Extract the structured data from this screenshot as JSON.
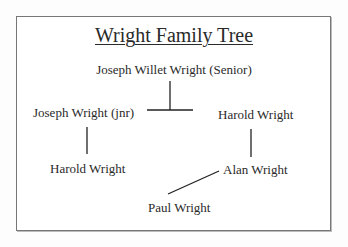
{
  "diagram": {
    "title": "Wright Family Tree",
    "nodes": {
      "root": "Joseph Willet Wright (Senior)",
      "child_left": "Joseph Wright (jnr)",
      "child_right": "Harold Wright",
      "grandchild_left": "Harold Wright",
      "grandchild_right": "Alan Wright",
      "great_grandchild": "Paul Wright"
    },
    "edges": [
      {
        "from": "root",
        "to": "child_left"
      },
      {
        "from": "root",
        "to": "child_right"
      },
      {
        "from": "child_left",
        "to": "grandchild_left"
      },
      {
        "from": "child_right",
        "to": "grandchild_right"
      },
      {
        "from": "grandchild_right",
        "to": "great_grandchild"
      }
    ],
    "colors": {
      "border": "#777777",
      "text": "#2a2a2a",
      "lines": "#222222"
    }
  }
}
